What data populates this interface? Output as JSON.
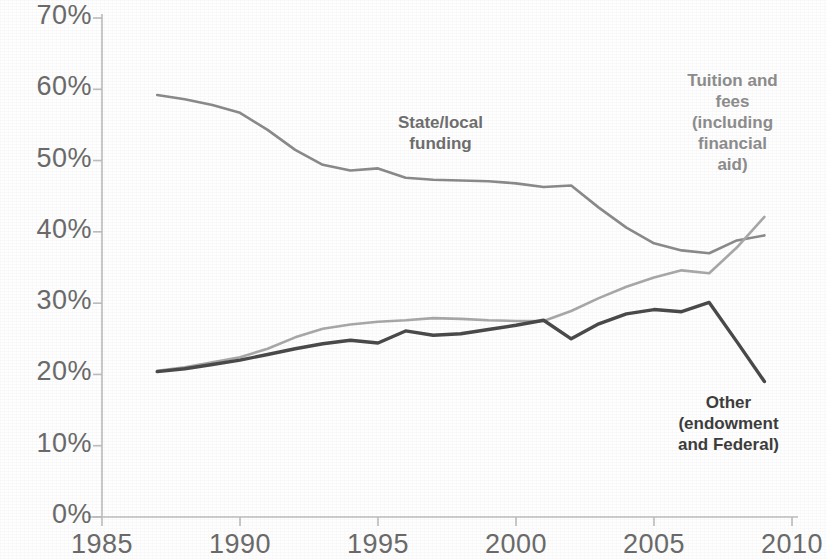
{
  "chart_data": {
    "type": "line",
    "title": "",
    "subtitle": "",
    "xlabel": "",
    "ylabel": "",
    "xlim": [
      1985,
      2010
    ],
    "ylim": [
      0,
      0.7
    ],
    "grid": false,
    "legend_position": "inline-annotations",
    "x_tick_labels": [
      "1985",
      "1990",
      "1995",
      "2000",
      "2005",
      "2010"
    ],
    "x_ticks": [
      1985,
      1990,
      1995,
      2000,
      2005,
      2010
    ],
    "y_tick_labels": [
      "0%",
      "10%",
      "20%",
      "30%",
      "40%",
      "50%",
      "60%",
      "70%"
    ],
    "y_ticks": [
      0,
      10,
      20,
      30,
      40,
      50,
      60,
      70
    ],
    "x": [
      1987,
      1988,
      1989,
      1990,
      1991,
      1992,
      1993,
      1994,
      1995,
      1996,
      1997,
      1998,
      1999,
      2000,
      2001,
      2002,
      2003,
      2004,
      2005,
      2006,
      2007,
      2008,
      2009
    ],
    "series": [
      {
        "name": "State/local funding",
        "color": "#8a8a8a",
        "values": [
          59.2,
          58.6,
          57.8,
          56.7,
          54.3,
          51.5,
          49.4,
          48.6,
          48.9,
          47.6,
          47.3,
          47.2,
          47.1,
          46.8,
          46.3,
          46.5,
          43.4,
          40.6,
          38.4,
          37.4,
          37.0,
          38.8,
          39.5
        ]
      },
      {
        "name": "Tuition and fees (including financial aid)",
        "color": "#a8a8a8",
        "values": [
          20.5,
          21.0,
          21.7,
          22.4,
          23.6,
          25.2,
          26.4,
          27.0,
          27.4,
          27.6,
          27.9,
          27.8,
          27.6,
          27.5,
          27.5,
          28.9,
          30.7,
          32.3,
          33.6,
          34.6,
          34.2,
          37.8,
          42.1
        ]
      },
      {
        "name": "Other (endowment and Federal)",
        "color": "#4a4a4a",
        "values": [
          20.4,
          20.8,
          21.4,
          22.0,
          22.8,
          23.6,
          24.3,
          24.8,
          24.4,
          26.1,
          25.5,
          25.7,
          26.3,
          26.9,
          27.6,
          25.0,
          27.1,
          28.5,
          29.1,
          28.8,
          30.1,
          24.6,
          19.0
        ]
      }
    ],
    "annotations": [
      {
        "id": "state-local",
        "text": "State/local\nfunding",
        "color": "#6f6f6f"
      },
      {
        "id": "tuition-fees",
        "text": "Tuition and\nfees\n(including\nfinancial\naid)",
        "color": "#8d8d8d"
      },
      {
        "id": "other-endowment-federal",
        "text": "Other\n(endowment\nand Federal)",
        "color": "#3d3d3d"
      }
    ],
    "axis_color": "#bcbcbc"
  }
}
